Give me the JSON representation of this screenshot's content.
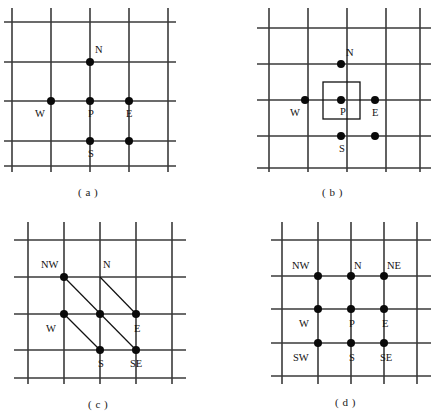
{
  "figure": {
    "background_color": "#ffffff",
    "line_color": "#3a3a3a",
    "dot_color": "#0a0a0a",
    "accent_color": "#111111",
    "width": 434,
    "height": 420
  },
  "panels": [
    {
      "id": "a",
      "caption": "( a )",
      "nodes": [
        {
          "name": "N",
          "label": "N",
          "label_pos": "above-right"
        },
        {
          "name": "W",
          "label": "W",
          "label_pos": "below-left"
        },
        {
          "name": "P",
          "label": "P",
          "label_pos": "below-right"
        },
        {
          "name": "E",
          "label": "E",
          "label_pos": "below-right"
        },
        {
          "name": "S",
          "label": "S",
          "label_pos": "below-right"
        }
      ],
      "dot_count": 5,
      "has_control_volume": false,
      "has_diagonals": false
    },
    {
      "id": "b",
      "caption": "( b )",
      "nodes": [
        {
          "name": "N",
          "label": "N",
          "label_pos": "above-right"
        },
        {
          "name": "W",
          "label": "W",
          "label_pos": "below-left"
        },
        {
          "name": "P",
          "label": "P",
          "label_pos": "below-right"
        },
        {
          "name": "E",
          "label": "E",
          "label_pos": "below-right"
        },
        {
          "name": "S",
          "label": "S",
          "label_pos": "below-right"
        }
      ],
      "dot_count": 5,
      "has_control_volume": true,
      "control_volume_fill": "hatched-diagonal",
      "has_diagonals": false
    },
    {
      "id": "c",
      "caption": "( c )",
      "nodes": [
        {
          "name": "NW",
          "label": "NW",
          "label_pos": "above-left"
        },
        {
          "name": "N",
          "label": "N",
          "label_pos": "above-right"
        },
        {
          "name": "W",
          "label": "W",
          "label_pos": "below-left"
        },
        {
          "name": "P",
          "label": "",
          "label_pos": "none"
        },
        {
          "name": "E",
          "label": "E",
          "label_pos": "below-right"
        },
        {
          "name": "S",
          "label": "S",
          "label_pos": "below-right"
        },
        {
          "name": "SE",
          "label": "SE",
          "label_pos": "below-right"
        }
      ],
      "dot_count": 6,
      "has_control_volume": false,
      "has_diagonals": true,
      "diagonal_count": 3
    },
    {
      "id": "d",
      "caption": "( d )",
      "nodes": [
        {
          "name": "NW",
          "label": "NW",
          "label_pos": "above-left"
        },
        {
          "name": "N",
          "label": "N",
          "label_pos": "above-right"
        },
        {
          "name": "NE",
          "label": "NE",
          "label_pos": "above-right"
        },
        {
          "name": "W",
          "label": "W",
          "label_pos": "below-left"
        },
        {
          "name": "P",
          "label": "P",
          "label_pos": "below-right"
        },
        {
          "name": "E",
          "label": "E",
          "label_pos": "below-right"
        },
        {
          "name": "SW",
          "label": "SW",
          "label_pos": "below-left"
        },
        {
          "name": "S",
          "label": "S",
          "label_pos": "below-right"
        },
        {
          "name": "SE",
          "label": "SE",
          "label_pos": "below-right"
        }
      ],
      "dot_count": 9,
      "has_control_volume": false,
      "has_diagonals": false
    }
  ]
}
